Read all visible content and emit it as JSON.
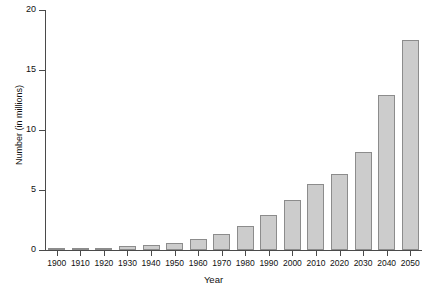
{
  "chart_data": {
    "type": "bar",
    "title": "",
    "xlabel": "Year",
    "ylabel": "Number (in millions)",
    "categories": [
      "1900",
      "1910",
      "1920",
      "1930",
      "1940",
      "1950",
      "1960",
      "1970",
      "1980",
      "1990",
      "2000",
      "2010",
      "2020",
      "2030",
      "2040",
      "2050"
    ],
    "values": [
      0.1,
      0.2,
      0.2,
      0.3,
      0.4,
      0.6,
      0.9,
      1.3,
      2.0,
      2.9,
      4.2,
      5.5,
      6.3,
      8.2,
      12.9,
      17.5
    ],
    "ylim": [
      0,
      20
    ],
    "yticks": [
      0,
      5,
      10,
      15,
      20
    ],
    "ytick_labels": [
      "0",
      "5",
      "10",
      "15",
      "20"
    ],
    "grid": false,
    "legend": false,
    "legend_position": "none",
    "bar_fill_color": "#cccccc",
    "bar_border_color": "#8c8c8c",
    "axis_color": "#4a4a4a"
  }
}
